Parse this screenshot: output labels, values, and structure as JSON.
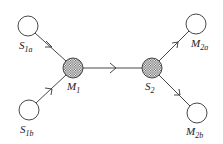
{
  "diagram": {
    "nodes": [
      {
        "id": "S1a",
        "label": "S",
        "sub": "1a",
        "type": "open",
        "cx": 28,
        "cy": 26
      },
      {
        "id": "S1b",
        "label": "S",
        "sub": "1b",
        "type": "open",
        "cx": 29,
        "cy": 110
      },
      {
        "id": "M1",
        "label": "M",
        "sub": "1",
        "type": "hatched",
        "cx": 73,
        "cy": 68
      },
      {
        "id": "S2",
        "label": "S",
        "sub": "2",
        "type": "hatched",
        "cx": 152,
        "cy": 68
      },
      {
        "id": "M2a",
        "label": "M",
        "sub": "2a",
        "type": "open",
        "cx": 196,
        "cy": 24
      },
      {
        "id": "M2b",
        "label": "M",
        "sub": "2b",
        "type": "open",
        "cx": 197,
        "cy": 113
      }
    ],
    "edges": [
      {
        "from": "S1a",
        "to": "M1"
      },
      {
        "from": "S1b",
        "to": "M1"
      },
      {
        "from": "M1",
        "to": "S2"
      },
      {
        "from": "S2",
        "to": "M2a"
      },
      {
        "from": "S2",
        "to": "M2b"
      }
    ],
    "labels": {
      "s1a": {
        "main": "S",
        "sub": "1a"
      },
      "s1b": {
        "main": "S",
        "sub": "1b"
      },
      "m1": {
        "main": "M",
        "sub": "1"
      },
      "s2": {
        "main": "S",
        "sub": "2"
      },
      "m2a": {
        "main": "M",
        "sub": "2a"
      },
      "m2b": {
        "main": "M",
        "sub": "2b"
      }
    },
    "colors": {
      "stroke": "#333333",
      "hatch": "#555555"
    }
  }
}
